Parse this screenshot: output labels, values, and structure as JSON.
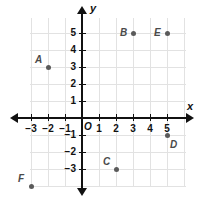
{
  "chart_data": {
    "type": "scatter",
    "title": "",
    "xlabel": "x",
    "ylabel": "y",
    "xlim": [
      -3.5,
      6
    ],
    "ylim": [
      -4.5,
      6
    ],
    "grid": true,
    "legend": false,
    "origin_label": "O",
    "x_ticks": [
      "−3",
      "−2",
      "−1",
      "1",
      "2",
      "3",
      "4",
      "5"
    ],
    "x_tick_values": [
      -3,
      -2,
      -1,
      1,
      2,
      3,
      4,
      5
    ],
    "y_ticks": [
      "5",
      "4",
      "3",
      "2",
      "1",
      "−1",
      "−2",
      "−3"
    ],
    "y_tick_values": [
      5,
      4,
      3,
      2,
      1,
      -1,
      -2,
      -3
    ],
    "points": [
      {
        "label": "A",
        "x": -2,
        "y": 3,
        "label_pos": "upper-left"
      },
      {
        "label": "B",
        "x": 3,
        "y": 5,
        "label_pos": "left"
      },
      {
        "label": "C",
        "x": 2,
        "y": -3,
        "label_pos": "upper-left"
      },
      {
        "label": "D",
        "x": 5,
        "y": -1,
        "label_pos": "lower-right"
      },
      {
        "label": "E",
        "x": 5,
        "y": 5,
        "label_pos": "left"
      },
      {
        "label": "F",
        "x": -3,
        "y": -4,
        "label_pos": "upper-left"
      }
    ],
    "colors": {
      "axis": "#111111",
      "grid": "#e2e2e2",
      "point": "#5a5a5a",
      "label": "#4a4a4a",
      "background": "#ffffff"
    }
  }
}
